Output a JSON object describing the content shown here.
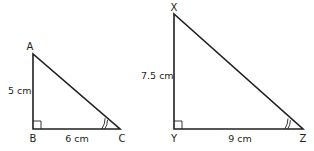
{
  "triangles": [
    {
      "id": "ABC",
      "vertices": {
        "A": "A",
        "B": "B",
        "C": "C"
      },
      "sides": {
        "AB": "5 cm",
        "BC": "6 cm"
      },
      "right_angle_at": "B",
      "marked_angle_at": "C"
    },
    {
      "id": "XYZ",
      "vertices": {
        "X": "X",
        "Y": "Y",
        "Z": "Z"
      },
      "sides": {
        "XY": "7.5 cm",
        "YZ": "9 cm"
      },
      "right_angle_at": "Y",
      "marked_angle_at": "Z"
    }
  ],
  "colors": {
    "stroke": "#231f20",
    "background": "#ffffff"
  }
}
